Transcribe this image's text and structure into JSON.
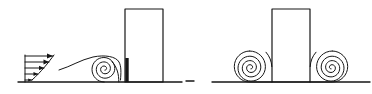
{
  "figure": {
    "title": "Airflow around a building: approach velocity profile, separation streamline and standing vortices",
    "background_color": "#ffffff",
    "line_color": "#161616",
    "width": 372,
    "height": 94,
    "panels": [
      {
        "id": "side-elevation",
        "name": "Side elevation view",
        "caption": "",
        "ground_line": {
          "x1": 18,
          "y1": 82,
          "x2": 182,
          "y2": 82
        },
        "building": {
          "name": "building-rectangle",
          "x": 125,
          "y": 9,
          "width": 38,
          "height": 73,
          "filled": false
        },
        "velocity_profile": {
          "name": "approach-velocity-profile",
          "base_x": 25,
          "base_y": 82,
          "top_y": 55,
          "arrow_count": 5,
          "arrow_lengths": [
            29,
            26,
            22,
            17,
            10
          ],
          "description": "Boundary-layer wind speed profile with arrows increasing in length with height"
        },
        "streamline": {
          "name": "separation-streamline",
          "description": "Curved streamline sweeping from upstream over the vortex toward the building face"
        },
        "vortex": {
          "name": "standing-vortex-spiral",
          "center_x": 104,
          "center_y": 71,
          "turns": 3,
          "outer_radius": 14,
          "rotation": "clockwise"
        },
        "downwash_mark": {
          "name": "downwash-stagnation-line",
          "x": 127,
          "y1": 58,
          "y2": 82,
          "style": "thick"
        }
      },
      {
        "id": "front-elevation",
        "name": "Front elevation view",
        "caption": "",
        "ground_line": {
          "x1": 212,
          "y1": 82,
          "x2": 370,
          "y2": 82
        },
        "ground_stub": {
          "x1": 186,
          "y1": 81,
          "x2": 194,
          "y2": 81
        },
        "building": {
          "name": "building-rectangle",
          "x": 272,
          "y": 9,
          "width": 38,
          "height": 73,
          "filled": false
        },
        "vortices": [
          {
            "name": "horseshoe-vortex-left",
            "center_x": 250,
            "center_y": 68,
            "turns": 3,
            "outer_radius": 15,
            "rotation": "clockwise"
          },
          {
            "name": "horseshoe-vortex-right",
            "center_x": 332,
            "center_y": 68,
            "turns": 3,
            "outer_radius": 15,
            "rotation": "counter-clockwise"
          }
        ]
      }
    ]
  }
}
